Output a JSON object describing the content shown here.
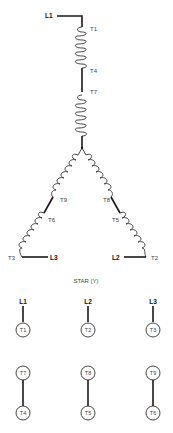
{
  "diagram": {
    "title": "STAR (Y)",
    "lines": {
      "L1": "L1",
      "L2": "L2",
      "L3": "L3"
    },
    "winding_labels": {
      "T1": "T1",
      "T4": "T4",
      "T7": "T7",
      "T9": "T9",
      "T6": "T6",
      "T3": "T3",
      "T8": "T8",
      "T5": "T5",
      "T2": "T2"
    },
    "connection_table": {
      "line_row": [
        {
          "line": "L1",
          "terminal": "T1"
        },
        {
          "line": "L2",
          "terminal": "T2"
        },
        {
          "line": "L3",
          "terminal": "T3"
        }
      ],
      "jumper_row": [
        {
          "top": "T7",
          "bottom": "T4"
        },
        {
          "top": "T8",
          "bottom": "T5"
        },
        {
          "top": "T9",
          "bottom": "T6"
        }
      ]
    }
  }
}
